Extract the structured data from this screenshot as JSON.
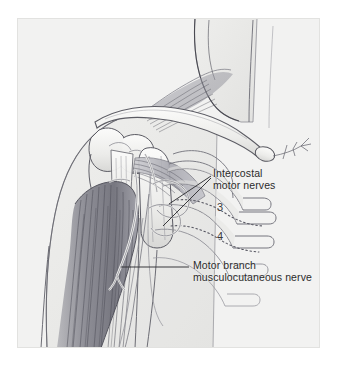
{
  "figure": {
    "background_color": "#ffffff",
    "panel_color": "#f2f2f1",
    "ink_color": "#2b2b2b"
  },
  "labels": {
    "intercostal": {
      "line1": "Intercostal",
      "line2": "motor nerves"
    },
    "motor_branch": {
      "line1": "Motor branch",
      "line2": "musculocutaneous nerve"
    }
  },
  "rib_numbers": [
    {
      "value": "3"
    },
    {
      "value": "4"
    }
  ],
  "structures": [
    {
      "name": "clavicle"
    },
    {
      "name": "scapula"
    },
    {
      "name": "humerus"
    },
    {
      "name": "biceps-brachii-muscle"
    },
    {
      "name": "pectoralis-muscle"
    },
    {
      "name": "rib-cage"
    },
    {
      "name": "intercostal-nerve-3"
    },
    {
      "name": "intercostal-nerve-4"
    },
    {
      "name": "musculocutaneous-nerve"
    }
  ]
}
